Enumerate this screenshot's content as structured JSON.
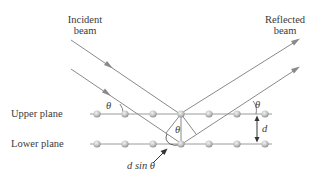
{
  "diagram": {
    "labels": {
      "incident_line1": "Incident",
      "incident_line2": "beam",
      "reflected_line1": "Reflected",
      "reflected_line2": "beam",
      "upper_plane": "Upper plane",
      "lower_plane": "Lower plane",
      "path_difference": "d sin θ",
      "theta": "θ",
      "spacing": "d"
    },
    "colors": {
      "ray": "#8a8a8a",
      "plane_line": "#9a9a9a",
      "atom_fill": "#c4c4c4",
      "atom_edge": "#8e8e8e",
      "text": "#3a3a3a",
      "arrow": "#333333"
    },
    "planes": [
      {
        "name": "upper",
        "y": 114,
        "atoms_x": [
          97,
          125,
          153,
          181,
          209,
          237,
          265
        ]
      },
      {
        "name": "lower",
        "y": 144,
        "atoms_x": [
          97,
          125,
          153,
          181,
          209,
          237,
          265
        ]
      }
    ],
    "rays": [
      {
        "name": "incident-upper",
        "from": [
          71,
          40
        ],
        "to": [
          180,
          114
        ]
      },
      {
        "name": "incident-lower",
        "from": [
          71,
          69
        ],
        "to": [
          182,
          144
        ]
      },
      {
        "name": "reflected-upper",
        "from": [
          180,
          114
        ],
        "to": [
          298,
          40
        ]
      },
      {
        "name": "reflected-lower",
        "from": [
          182,
          144
        ],
        "to": [
          298,
          68
        ]
      }
    ]
  }
}
